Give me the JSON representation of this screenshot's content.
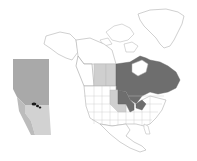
{
  "map": {
    "type": "range-map",
    "region": "North America",
    "colors": {
      "background": "#ffffff",
      "border": "#b8b8b8",
      "primary_range": "#6e6e6e",
      "secondary_range": "#cfcfcf",
      "inset_base": "#a9a9a9",
      "inset_south": "#d2d2d2",
      "inset_points": "#1a1a1a"
    },
    "primary_range_regions": [
      "Manitoba",
      "Ontario",
      "Quebec",
      "Minnesota",
      "Wisconsin",
      "Michigan"
    ],
    "secondary_range_regions": [
      "Alberta",
      "Saskatchewan",
      "North Dakota",
      "South Dakota",
      "Iowa"
    ],
    "inset": {
      "region": "Alberta",
      "occurrence_points": 3
    }
  }
}
